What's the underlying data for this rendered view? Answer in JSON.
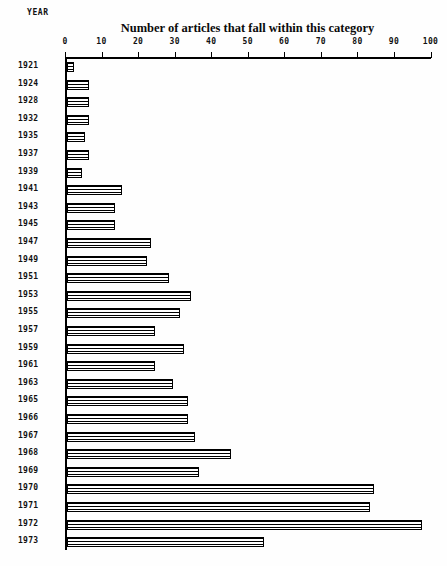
{
  "chart_data": {
    "type": "bar",
    "orientation": "horizontal",
    "title": "Number of articles that fall within this category",
    "xlabel": "Number of articles that fall within this category",
    "ylabel": "YEAR",
    "xlim": [
      0,
      100
    ],
    "ylim": null,
    "grid": false,
    "legend": null,
    "legend_position": "none",
    "xticks": [
      "0",
      "10",
      "20",
      "30",
      "40",
      "50",
      "60",
      "70",
      "80",
      "90",
      "100"
    ],
    "xtick_values": [
      0,
      10,
      20,
      30,
      40,
      50,
      60,
      70,
      80,
      90,
      100
    ],
    "axis_position": "top",
    "categories": [
      "1921",
      "1924",
      "1928",
      "1932",
      "1935",
      "1937",
      "1939",
      "1941",
      "1943",
      "1945",
      "1947",
      "1949",
      "1951",
      "1953",
      "1955",
      "1957",
      "1959",
      "1961",
      "1963",
      "1965",
      "1966",
      "1967",
      "1968",
      "1969",
      "1970",
      "1971",
      "1972",
      "1973"
    ],
    "values": [
      2,
      6,
      6,
      6,
      5,
      6,
      4,
      15,
      13,
      13,
      23,
      22,
      28,
      34,
      31,
      24,
      32,
      24,
      29,
      33,
      33,
      35,
      45,
      36,
      84,
      83,
      97,
      54
    ],
    "bars": [
      {
        "year": "1921",
        "value": 2
      },
      {
        "year": "1924",
        "value": 6
      },
      {
        "year": "1928",
        "value": 6
      },
      {
        "year": "1932",
        "value": 6
      },
      {
        "year": "1935",
        "value": 5
      },
      {
        "year": "1937",
        "value": 6
      },
      {
        "year": "1939",
        "value": 4
      },
      {
        "year": "1941",
        "value": 15
      },
      {
        "year": "1943",
        "value": 13
      },
      {
        "year": "1945",
        "value": 13
      },
      {
        "year": "1947",
        "value": 23
      },
      {
        "year": "1949",
        "value": 22
      },
      {
        "year": "1951",
        "value": 28
      },
      {
        "year": "1953",
        "value": 34
      },
      {
        "year": "1955",
        "value": 31
      },
      {
        "year": "1957",
        "value": 24
      },
      {
        "year": "1959",
        "value": 32
      },
      {
        "year": "1961",
        "value": 24
      },
      {
        "year": "1963",
        "value": 29
      },
      {
        "year": "1965",
        "value": 33
      },
      {
        "year": "1966",
        "value": 33
      },
      {
        "year": "1967",
        "value": 35
      },
      {
        "year": "1968",
        "value": 45
      },
      {
        "year": "1969",
        "value": 36
      },
      {
        "year": "1970",
        "value": 84
      },
      {
        "year": "1971",
        "value": 83
      },
      {
        "year": "1972",
        "value": 97
      },
      {
        "year": "1973",
        "value": 54
      }
    ],
    "colors": {
      "bar_fill": "#ffffff",
      "bar_hatch": "#000000",
      "axis": "#000000",
      "text": "#111111",
      "background": "#ffffff"
    }
  },
  "layout": {
    "plot_left_px": 65,
    "plot_top_px": 57,
    "px_per_unit": 3.655,
    "row_height_px": 17.6,
    "first_row_top_px": 61
  }
}
